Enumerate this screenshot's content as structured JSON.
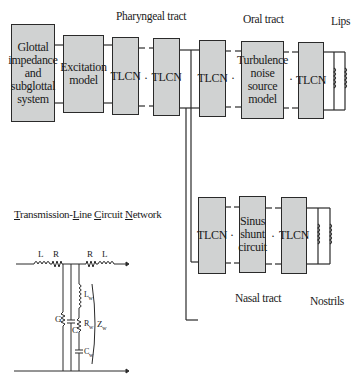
{
  "diagram": {
    "section_labels": {
      "pharyngeal": "Pharyngeal tract",
      "oral": "Oral tract",
      "lips": "Lips",
      "nasal": "Nasal tract",
      "nostrils": "Nostrils"
    },
    "blocks": {
      "glottal": [
        "Glottal",
        "impedance",
        "and",
        "subglottal",
        "system"
      ],
      "excitation": [
        "Excitation",
        "model"
      ],
      "tlcn_ph1": "TLCN",
      "tlcn_ph2": "TLCN",
      "tlcn_branch": "TLCN",
      "turbulence": [
        "Turbulence",
        "noise",
        "source",
        "model"
      ],
      "tlcn_oral": "TLCN",
      "tlcn_nasal1": "TLCN",
      "sinus": [
        "Sinus",
        "shunt",
        "circuit"
      ],
      "tlcn_nasal2": "TLCN"
    },
    "continuation_dot": "·",
    "circuit": {
      "title_parts": [
        "T",
        "ransmission-",
        "L",
        "ine ",
        "C",
        "ircuit ",
        "N",
        "etwork"
      ],
      "labels": {
        "L_left": "L",
        "R_left": "R",
        "R_right": "R",
        "L_right": "L",
        "G": "G",
        "C": "C",
        "Lw": "L",
        "Lw_sub": "w",
        "Rw": "R",
        "Rw_sub": "w",
        "Cw": "C",
        "Cw_sub": "w",
        "Zw": "Z",
        "Zw_sub": "w"
      }
    }
  }
}
